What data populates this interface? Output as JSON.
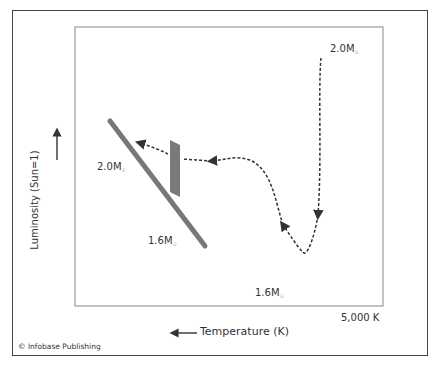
{
  "diagram": {
    "title": "",
    "y_axis_label": "Luminosity (Sun=1)",
    "x_axis_label": "Temperature (K)",
    "x_tick_label": "5,000 K",
    "credit": "© Infobase Publishing",
    "labels": {
      "top_right_mass": "2.0M",
      "left_mass_upper": "2.0M",
      "left_mass_lower": "1.6M",
      "bottom_mass": "1.6M",
      "solar_subscript": "☉"
    },
    "colors": {
      "main_sequence": "#777777",
      "band": "#777777",
      "path": "#333333",
      "frame": "#444444"
    }
  }
}
